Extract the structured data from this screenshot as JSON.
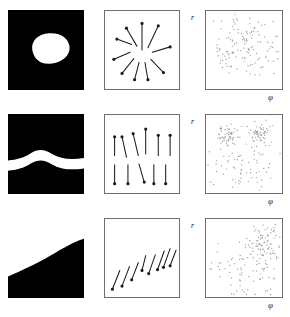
{
  "figure": {
    "rows": 3,
    "columns": 3,
    "column_kinds": [
      "binary-image",
      "vector-field",
      "scatter-plot"
    ],
    "background_color": "#ffffff",
    "image_fill_color": "#000000",
    "image_object_color": "#ffffff",
    "panel_border_color": "#6e6e6e",
    "arrow_color": "#1a1a1a",
    "point_color": "#9a9a9a"
  },
  "axes": {
    "r_label": "r",
    "phi_label": "φ"
  },
  "rows": [
    {
      "id": "row-0",
      "name": "blob-row",
      "image": {
        "name": "binary-blob",
        "description": "white convex blob on black background",
        "shape": "blob"
      },
      "vectors": {
        "name": "radial-outward-field",
        "description": "arrows radiating outward from a common centre",
        "pattern": "radial",
        "count": 10
      },
      "scatter": {
        "name": "scatter-uniform-band",
        "description": "points spread across a wide horizontal band in r-phi space",
        "point_count": 150,
        "r_label": "r",
        "phi_label": "φ"
      }
    },
    {
      "id": "row-1",
      "name": "band-row",
      "image": {
        "name": "binary-horizontal-band",
        "description": "wavy white horizontal band across black background",
        "shape": "band"
      },
      "vectors": {
        "name": "opposing-vertical-field",
        "description": "upper row of up-pointing arrows and lower row of down-pointing arrows",
        "pattern": "anti-parallel-vertical",
        "count": 11
      },
      "scatter": {
        "name": "scatter-two-clusters",
        "description": "two dense clusters in the upper half plus sparse background points",
        "point_count": 190,
        "r_label": "r",
        "phi_label": "φ"
      }
    },
    {
      "id": "row-2",
      "name": "edge-row",
      "image": {
        "name": "binary-curved-edge",
        "description": "white region above a curved boundary, black region below",
        "shape": "edge"
      },
      "vectors": {
        "name": "oblique-downleft-field",
        "description": "parallel arrows pointing down-left, arranged along a rising diagonal",
        "pattern": "parallel-oblique",
        "count": 8
      },
      "scatter": {
        "name": "scatter-corner-cluster",
        "description": "dense cluster in the upper-right with sparse points elsewhere",
        "point_count": 175,
        "r_label": "r",
        "phi_label": "φ"
      }
    }
  ],
  "chart_data": {
    "type": "scatter",
    "xlabel": "φ",
    "ylabel": "r",
    "xlim": [
      0,
      1
    ],
    "ylim": [
      0,
      1
    ],
    "grid": false,
    "legend": null,
    "panels": [
      {
        "name": "row-0-scatter",
        "description": "points spread fairly uniformly in a broad horizontal band",
        "clusters": [
          {
            "cx": 0.5,
            "cy": 0.52,
            "sx": 0.3,
            "sy": 0.2,
            "n": 150
          }
        ]
      },
      {
        "name": "row-1-scatter",
        "description": "two dense clusters near the top plus a sparse uniform background",
        "clusters": [
          {
            "cx": 0.28,
            "cy": 0.74,
            "sx": 0.08,
            "sy": 0.07,
            "n": 55
          },
          {
            "cx": 0.7,
            "cy": 0.76,
            "sx": 0.08,
            "sy": 0.07,
            "n": 55
          },
          {
            "cx": 0.5,
            "cy": 0.33,
            "sx": 0.3,
            "sy": 0.18,
            "n": 80
          }
        ]
      },
      {
        "name": "row-2-scatter",
        "description": "one dense cluster in the upper right corner plus sparse points",
        "clusters": [
          {
            "cx": 0.76,
            "cy": 0.7,
            "sx": 0.11,
            "sy": 0.13,
            "n": 85
          },
          {
            "cx": 0.45,
            "cy": 0.32,
            "sx": 0.28,
            "sy": 0.2,
            "n": 90
          }
        ]
      }
    ]
  },
  "vector_fields": [
    {
      "name": "row-0-vectors",
      "arrows": [
        {
          "x1": 0.5,
          "y1": 0.5,
          "x2": 0.5,
          "y2": 0.16
        },
        {
          "x1": 0.58,
          "y1": 0.47,
          "x2": 0.72,
          "y2": 0.19
        },
        {
          "x1": 0.64,
          "y1": 0.53,
          "x2": 0.88,
          "y2": 0.46
        },
        {
          "x1": 0.62,
          "y1": 0.62,
          "x2": 0.79,
          "y2": 0.79
        },
        {
          "x1": 0.54,
          "y1": 0.66,
          "x2": 0.58,
          "y2": 0.88
        },
        {
          "x1": 0.46,
          "y1": 0.66,
          "x2": 0.4,
          "y2": 0.88
        },
        {
          "x1": 0.39,
          "y1": 0.61,
          "x2": 0.23,
          "y2": 0.8
        },
        {
          "x1": 0.34,
          "y1": 0.53,
          "x2": 0.12,
          "y2": 0.62
        },
        {
          "x1": 0.36,
          "y1": 0.43,
          "x2": 0.16,
          "y2": 0.36
        },
        {
          "x1": 0.43,
          "y1": 0.45,
          "x2": 0.29,
          "y2": 0.22
        }
      ]
    },
    {
      "name": "row-1-vectors",
      "arrows": [
        {
          "x1": 0.13,
          "y1": 0.52,
          "x2": 0.13,
          "y2": 0.28
        },
        {
          "x1": 0.29,
          "y1": 0.54,
          "x2": 0.23,
          "y2": 0.28
        },
        {
          "x1": 0.45,
          "y1": 0.52,
          "x2": 0.38,
          "y2": 0.24
        },
        {
          "x1": 0.55,
          "y1": 0.5,
          "x2": 0.55,
          "y2": 0.18
        },
        {
          "x1": 0.72,
          "y1": 0.52,
          "x2": 0.72,
          "y2": 0.26
        },
        {
          "x1": 0.88,
          "y1": 0.52,
          "x2": 0.88,
          "y2": 0.26
        },
        {
          "x1": 0.13,
          "y1": 0.64,
          "x2": 0.13,
          "y2": 0.88
        },
        {
          "x1": 0.31,
          "y1": 0.64,
          "x2": 0.31,
          "y2": 0.88
        },
        {
          "x1": 0.46,
          "y1": 0.63,
          "x2": 0.53,
          "y2": 0.86
        },
        {
          "x1": 0.66,
          "y1": 0.64,
          "x2": 0.66,
          "y2": 0.88
        },
        {
          "x1": 0.82,
          "y1": 0.64,
          "x2": 0.82,
          "y2": 0.88
        }
      ]
    },
    {
      "name": "row-2-vectors",
      "arrows": [
        {
          "x1": 0.2,
          "y1": 0.66,
          "x2": 0.1,
          "y2": 0.9
        },
        {
          "x1": 0.33,
          "y1": 0.61,
          "x2": 0.23,
          "y2": 0.86
        },
        {
          "x1": 0.45,
          "y1": 0.56,
          "x2": 0.36,
          "y2": 0.78
        },
        {
          "x1": 0.55,
          "y1": 0.47,
          "x2": 0.5,
          "y2": 0.66
        },
        {
          "x1": 0.68,
          "y1": 0.46,
          "x2": 0.59,
          "y2": 0.7
        },
        {
          "x1": 0.8,
          "y1": 0.41,
          "x2": 0.71,
          "y2": 0.65
        },
        {
          "x1": 0.88,
          "y1": 0.38,
          "x2": 0.79,
          "y2": 0.62
        },
        {
          "x1": 0.96,
          "y1": 0.4,
          "x2": 0.88,
          "y2": 0.6
        }
      ]
    }
  ]
}
